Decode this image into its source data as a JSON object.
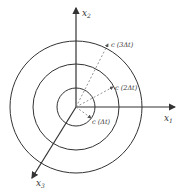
{
  "diagram": {
    "center": [
      76,
      107
    ],
    "circles": [
      {
        "name": "inner",
        "radius": 19,
        "label": "c (Δt)",
        "label_pos": [
          90,
          120
        ]
      },
      {
        "name": "middle",
        "radius": 43,
        "label": "c (2Δt)",
        "label_pos": [
          114,
          89
        ]
      },
      {
        "name": "outer",
        "radius": 66,
        "label": "c (3Δt)",
        "label_pos": [
          111,
          44
        ]
      }
    ],
    "axes": {
      "x1": {
        "label": "x",
        "sub": "1"
      },
      "x2": {
        "label": "x",
        "sub": "2"
      },
      "x3": {
        "label": "x",
        "sub": "3"
      }
    },
    "colors": {
      "line": "#333333",
      "dashed": "#777777"
    }
  }
}
